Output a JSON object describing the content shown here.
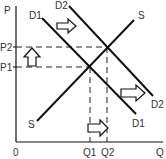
{
  "diagram": {
    "type": "supply-demand",
    "axes": {
      "y_label": "P",
      "x_label": "Q",
      "origin_label": "0"
    },
    "price_levels": {
      "p1": "P1",
      "p2": "P2"
    },
    "quantity_levels": {
      "q1": "Q1",
      "q2": "Q2"
    },
    "curves": {
      "supply": {
        "label_top": "S",
        "label_bottom": "S"
      },
      "demand1": {
        "label_top": "D1",
        "label_bottom": "D1"
      },
      "demand2": {
        "label_top": "D2",
        "label_bottom": "D2"
      }
    },
    "arrows": [
      {
        "name": "demand-shift-top",
        "direction": "right"
      },
      {
        "name": "demand-shift-bottom",
        "direction": "right"
      },
      {
        "name": "price-increase",
        "direction": "up"
      },
      {
        "name": "quantity-increase",
        "direction": "right"
      }
    ],
    "colors": {
      "line": "#111111",
      "text": "#333333",
      "background": "#ffffff"
    }
  }
}
